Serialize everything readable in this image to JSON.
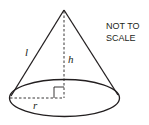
{
  "diagram": {
    "type": "cone",
    "note_line1": "NOT TO",
    "note_line2": "SCALE",
    "labels": {
      "slant_height": "l",
      "height": "h",
      "radius": "r"
    },
    "colors": {
      "stroke": "#231f20",
      "text": "#231f20",
      "background": "#ffffff"
    }
  }
}
